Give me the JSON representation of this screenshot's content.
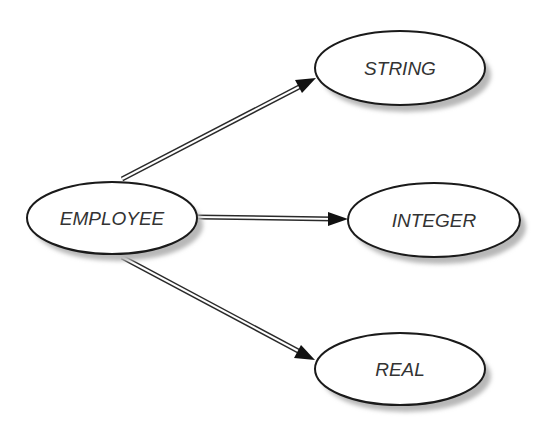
{
  "diagram": {
    "type": "entity-attribute-graph",
    "nodes": [
      {
        "id": "employee",
        "label": "EMPLOYEE",
        "cx": 112,
        "cy": 218,
        "rx": 85,
        "ry": 36
      },
      {
        "id": "string",
        "label": "STRING",
        "cx": 400,
        "cy": 68,
        "rx": 85,
        "ry": 37
      },
      {
        "id": "integer",
        "label": "INTEGER",
        "cx": 434,
        "cy": 220,
        "rx": 86,
        "ry": 37
      },
      {
        "id": "real",
        "label": "REAL",
        "cx": 400,
        "cy": 369,
        "rx": 85,
        "ry": 36
      }
    ],
    "edges": [
      {
        "from": "employee",
        "to": "string",
        "x1": 122,
        "y1": 179,
        "x2": 316,
        "y2": 78,
        "style": "double-line-arrow"
      },
      {
        "from": "employee",
        "to": "integer",
        "x1": 197,
        "y1": 217,
        "x2": 348,
        "y2": 219,
        "style": "double-line-arrow"
      },
      {
        "from": "employee",
        "to": "real",
        "x1": 122,
        "y1": 257,
        "x2": 315,
        "y2": 360,
        "style": "double-line-arrow"
      }
    ],
    "colors": {
      "outline": "#1a1a1a",
      "shadow": "#b8b8b8",
      "text": "#333333",
      "background": "#ffffff"
    }
  }
}
